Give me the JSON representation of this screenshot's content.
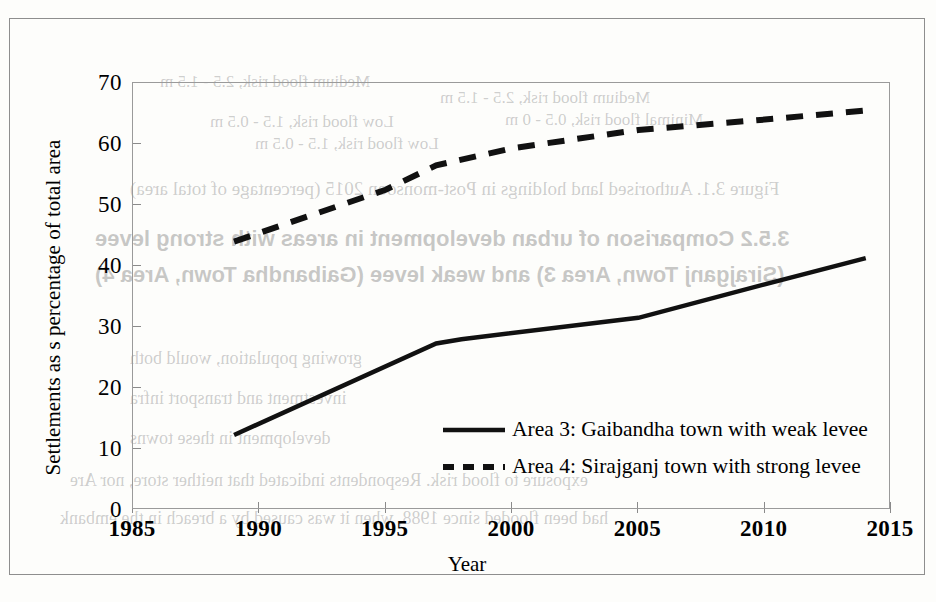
{
  "chart_data": {
    "type": "line",
    "title": "",
    "xlabel": "Year",
    "ylabel": "Settlements as s percentage of total area",
    "xlim": [
      1985,
      2015
    ],
    "ylim": [
      0,
      70
    ],
    "xticks": [
      "1985",
      "1990",
      "1995",
      "2000",
      "2005",
      "2010",
      "2015"
    ],
    "yticks": [
      "0",
      "10",
      "20",
      "30",
      "40",
      "50",
      "60",
      "70"
    ],
    "grid": false,
    "legend_position": "inside-lower-right",
    "series": [
      {
        "name": "Area 3: Gaibandha town with weak levee",
        "style": "solid",
        "color": "#111111",
        "x": [
          1989,
          1997,
          1998,
          2005,
          2010,
          2014
        ],
        "values": [
          12.3,
          27.3,
          28.0,
          31.5,
          37.0,
          41.3
        ]
      },
      {
        "name": "Area 4: Sirajganj town with strong levee",
        "style": "dashed",
        "color": "#111111",
        "x": [
          1989,
          1995,
          1997,
          2000,
          2005,
          2010,
          2014
        ],
        "values": [
          44.0,
          52.5,
          56.5,
          59.3,
          62.3,
          64.0,
          65.5
        ]
      }
    ]
  },
  "legend": {
    "items": [
      {
        "label": "Area 3: Gaibandha town with weak levee",
        "style": "solid"
      },
      {
        "label": "Area 4: Sirajganj town with strong levee",
        "style": "dashed"
      }
    ]
  },
  "axes": {
    "x_title": "Year",
    "y_title": "Settlements as s percentage of total area"
  },
  "scan_artifacts": {
    "bleed_lines": [
      "Medium flood risk, 2.5 - 1.5 m",
      "Low flood risk, 1.5 - 0.5 m",
      "Minimal flood risk, 0.5 - 0 m",
      "Area 3 in Post-monsoon 2015 (percentage of total area)",
      "Figure 3.1. Authorised land holdings in Post-monsoon 2015 (percentage of total area)",
      "3.5.2  Comparison  of  urban  development  in  areas  with  strong  levee",
      "(Sirajganj Town, Area 3) and weak levee (Gaibandha Town, Area 4)",
      "growing population, would both",
      "investment and transport infra",
      "development in these towns",
      "exposure to  flood risk. Respondents indicated that neither store, nor Are",
      "had been flooded since 1988, when it was caused by a breach in the embank"
    ]
  },
  "colors": {
    "line": "#111111",
    "axis": "#8e8e8e",
    "frame": "#8e8e8e",
    "paper": "#fdfdfb"
  }
}
